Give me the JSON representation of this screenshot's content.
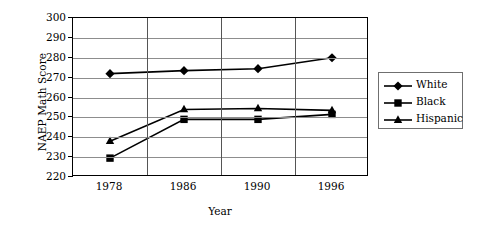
{
  "chart_data": {
    "type": "line",
    "title": "",
    "xlabel": "Year",
    "ylabel": "NAEP Math Score",
    "categories": [
      "1978",
      "1986",
      "1990",
      "1996"
    ],
    "ylim": [
      220,
      300
    ],
    "yticks": [
      300,
      290,
      280,
      270,
      260,
      250,
      240,
      230,
      220
    ],
    "grid": true,
    "legend_position": "right",
    "series": [
      {
        "name": "White",
        "marker": "diamond",
        "values": [
          272,
          273.5,
          274.5,
          280
        ]
      },
      {
        "name": "Black",
        "marker": "square",
        "values": [
          229.5,
          249,
          249,
          251.5
        ]
      },
      {
        "name": "Hispanic",
        "marker": "triangle",
        "values": [
          238,
          254,
          254.5,
          253.5
        ]
      }
    ]
  },
  "axis": {
    "y_title": "NAEP Math Score",
    "x_title": "Year",
    "y_tick_labels": [
      "300",
      "290",
      "280",
      "270",
      "260",
      "250",
      "240",
      "230",
      "220"
    ],
    "x_tick_labels": [
      "1978",
      "1986",
      "1990",
      "1996"
    ]
  },
  "legend": {
    "entries": [
      {
        "label": "White",
        "marker": "diamond"
      },
      {
        "label": "Black",
        "marker": "square"
      },
      {
        "label": "Hispanic",
        "marker": "triangle"
      }
    ]
  },
  "colors": {
    "series_line": "#000000",
    "gridline": "#8d8d8d",
    "vertical_gridline": "#555555",
    "frame": "#000000",
    "legend_border": "#6f6f6f",
    "background": "#ffffff"
  }
}
